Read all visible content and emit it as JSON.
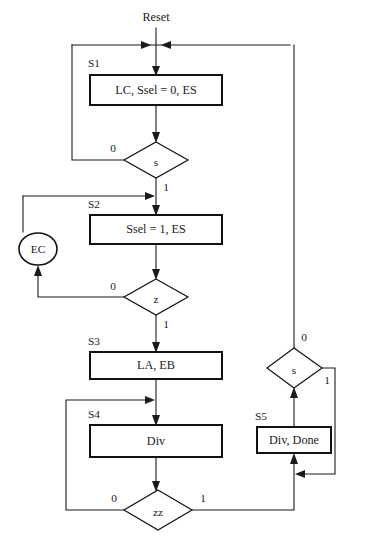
{
  "diagram": {
    "reset_label": "Reset",
    "colors": {
      "background": "#ffffff",
      "line": "#1a1a1a",
      "box_border": "#111111",
      "text": "#1a1a1a"
    },
    "states": [
      {
        "id": "S1",
        "name_label": "S1",
        "body_text": "LC, Ssel = 0, ES",
        "shape": "rectangle",
        "x": 90,
        "y": 75,
        "width": 132,
        "height": 30
      },
      {
        "id": "S2",
        "name_label": "S2",
        "body_text": "Ssel = 1, ES",
        "shape": "rectangle",
        "x": 90,
        "y": 215,
        "width": 132,
        "height": 29
      },
      {
        "id": "S3",
        "name_label": "S3",
        "body_text": "LA, EB",
        "shape": "rectangle",
        "x": 90,
        "y": 352,
        "width": 132,
        "height": 27
      },
      {
        "id": "S4",
        "name_label": "S4",
        "body_text": "Div",
        "shape": "rectangle",
        "x": 90,
        "y": 425,
        "width": 132,
        "height": 32
      },
      {
        "id": "S5",
        "name_label": "S5",
        "body_text": "Div, Done",
        "shape": "rectangle",
        "x": 257,
        "y": 427,
        "width": 74,
        "height": 26
      }
    ],
    "decisions": [
      {
        "id": "s1-decision",
        "condition": "s",
        "cx": 156,
        "cy": 160,
        "rx": 32,
        "ry": 18,
        "branch_false": "0",
        "branch_true": "1"
      },
      {
        "id": "z-decision",
        "condition": "z",
        "cx": 156,
        "cy": 297,
        "rx": 32,
        "ry": 18,
        "branch_false": "0",
        "branch_true": "1"
      },
      {
        "id": "zz-decision",
        "condition": "zz",
        "cx": 158,
        "cy": 510,
        "rx": 34,
        "ry": 20,
        "branch_false": "0",
        "branch_true": "1"
      },
      {
        "id": "s5-decision",
        "condition": "s",
        "cx": 295,
        "cy": 368,
        "rx": 27,
        "ry": 20,
        "branch_false": "0",
        "branch_true": "1"
      }
    ],
    "conditional_outputs": [
      {
        "id": "EC",
        "body_text": "EC",
        "shape": "oval",
        "cx": 38,
        "cy": 249,
        "rx": 19,
        "ry": 16
      }
    ],
    "branch_labels": {
      "s1_zero": "0",
      "s1_one": "1",
      "z_zero": "0",
      "z_one": "1",
      "zz_zero": "0",
      "zz_one": "1",
      "s5_zero": "0",
      "s5_one": "1"
    }
  }
}
